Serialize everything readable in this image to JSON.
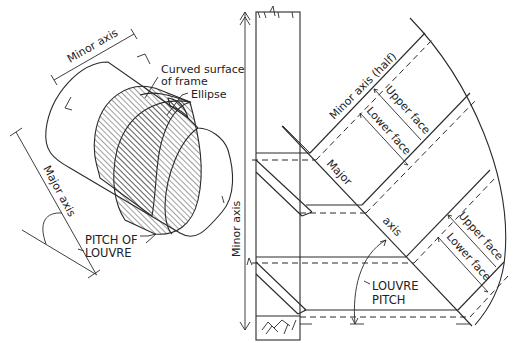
{
  "left_figure": {
    "minor_axis_label": "Minor axis",
    "curved_surface_label_line1": "Curved surface",
    "curved_surface_label_line2": "of frame",
    "ellipse_label": "Ellipse",
    "major_axis_label": "Major axis",
    "pitch_label_line1": "PITCH OF",
    "pitch_label_line2": "LOUVRE"
  },
  "right_figure": {
    "minor_axis_vertical_label": "Minor axis",
    "minor_axis_half_label": "Minor axis (half)",
    "upper_face_label_1": "Upper face",
    "lower_face_label_1": "Lower face",
    "major_label": "Major",
    "axis_label": "axis",
    "upper_face_label_2": "Upper face",
    "lower_face_label_2": "Lower face",
    "louvre_pitch_line1": "LOUVRE",
    "louvre_pitch_line2": "PITCH"
  },
  "colors": {
    "ink": "#2a2a2a",
    "background": "#ffffff"
  }
}
